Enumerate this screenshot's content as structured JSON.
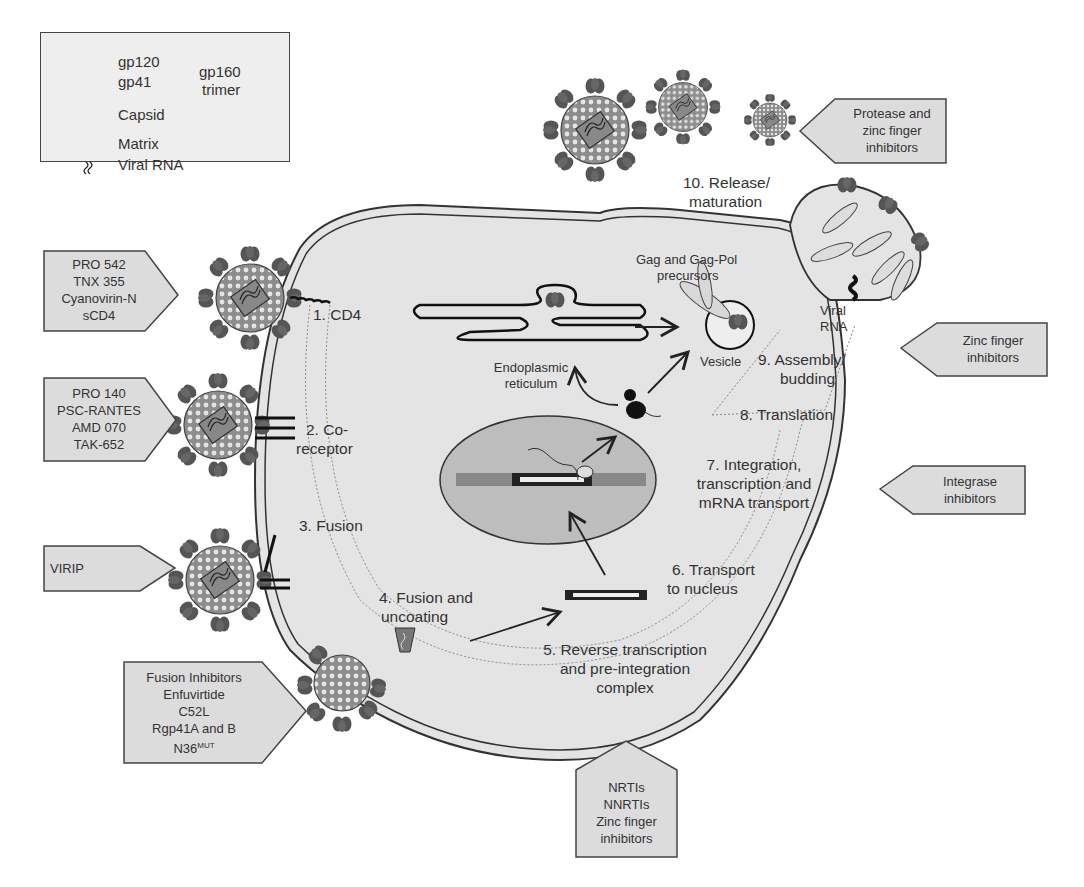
{
  "legend": {
    "gp120": "gp120",
    "gp41": "gp41",
    "gp160": "gp160",
    "trimer": "trimer",
    "capsid": "Capsid",
    "matrix": "Matrix",
    "viral_rna": "Viral RNA"
  },
  "steps": {
    "s1": "1. CD4",
    "s2a": "2. Co-",
    "s2b": "receptor",
    "s3": "3. Fusion",
    "s4a": "4. Fusion and",
    "s4b": "uncoating",
    "s5a": "5. Reverse transcription",
    "s5b": "and pre-integration",
    "s5c": "complex",
    "s6a": "6. Transport",
    "s6b": "to nucleus",
    "s7a": "7. Integration,",
    "s7b": "transcription and",
    "s7c": "mRNA transport",
    "s8": "8. Translation",
    "s9a": "9. Assembly/",
    "s9b": "budding",
    "s10a": "10. Release/",
    "s10b": "maturation"
  },
  "organelles": {
    "er_a": "Endoplasmic",
    "er_b": "reticulum",
    "vesicle": "Vesicle",
    "gag_a": "Gag and Gag-Pol",
    "gag_b": "precursors",
    "vrna_a": "Viral",
    "vrna_b": "RNA"
  },
  "inhibitor_boxes": {
    "cd4": [
      "PRO 542",
      "TNX 355",
      "Cyanovirin-N",
      "sCD4"
    ],
    "coreceptor": [
      "PRO 140",
      "PSC-RANTES",
      "AMD 070",
      "TAK-652"
    ],
    "fusion": [
      "VIRIP"
    ],
    "fusion_inhibitors": [
      "Fusion Inhibitors",
      "Enfuvirtide",
      "C52L",
      "Rgp41A and B",
      "N36"
    ],
    "fusion_inhibitors_sup": "MUT",
    "rt": [
      "NRTIs",
      "NNRTIs",
      "Zinc finger",
      "inhibitors"
    ],
    "integrase": [
      "Integrase",
      "inhibitors"
    ],
    "assembly": [
      "Zinc finger",
      "inhibitors"
    ],
    "release": [
      "Protease and",
      "zinc finger",
      "inhibitors"
    ]
  },
  "colors": {
    "cell_fill": "#e4e4e4",
    "box_fill": "#dcdcdc",
    "nucleus_fill": "#bdbdbd",
    "glyco": "#555555",
    "virion": "#9a9a9a",
    "outline": "#333333"
  }
}
